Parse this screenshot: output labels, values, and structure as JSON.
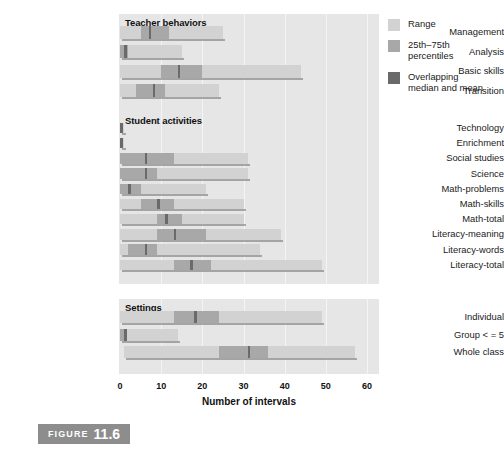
{
  "figure": {
    "caption_word": "FIGURE",
    "caption_number": "11.6"
  },
  "legend": {
    "items": [
      {
        "label": "Range",
        "color": "#d2d2d2",
        "key": "range"
      },
      {
        "label": "25th–75th\npercentiles",
        "color": "#a8a8a8",
        "key": "iqr"
      },
      {
        "label": "Overlapping\nmedian and mean",
        "color": "#6a6a6a",
        "key": "median"
      }
    ]
  },
  "chart_data": {
    "type": "bar",
    "title": "",
    "xlabel": "Number of intervals",
    "ylabel": "",
    "xlim": [
      0,
      60
    ],
    "xticks": [
      0,
      10,
      20,
      30,
      40,
      50,
      60
    ],
    "xtick_labels": [
      "0",
      "10",
      "20",
      "30",
      "40",
      "50",
      "60"
    ],
    "grid": true,
    "legend_position": "right",
    "orientation": "horizontal",
    "series": [
      {
        "name": "Range",
        "color": "#d2d2d2"
      },
      {
        "name": "25th–75th percentiles",
        "color": "#a8a8a8"
      },
      {
        "name": "Overlapping median and mean",
        "color": "#6a6a6a"
      }
    ],
    "panels": [
      {
        "title": "Teacher behaviors",
        "categories": [
          "Management",
          "Analysis",
          "Basic skills",
          "Transition"
        ],
        "bars": [
          {
            "category": "Management",
            "range_min": 0,
            "range_max": 25,
            "q1": 5,
            "q3": 12,
            "median": 7
          },
          {
            "category": "Analysis",
            "range_min": 0,
            "range_max": 15,
            "q1": 0,
            "q3": 2,
            "median": 1
          },
          {
            "category": "Basic skills",
            "range_min": 0,
            "range_max": 44,
            "q1": 10,
            "q3": 20,
            "median": 14
          },
          {
            "category": "Transition",
            "range_min": 0,
            "range_max": 24,
            "q1": 4,
            "q3": 11,
            "median": 8
          }
        ]
      },
      {
        "title": "Student activities",
        "categories": [
          "Technology",
          "Enrichment",
          "Social studies",
          "Science",
          "Math-problems",
          "Math-skills",
          "Math-total",
          "Literacy-meaning",
          "Literacy-words",
          "Literacy-total"
        ],
        "bars": [
          {
            "category": "Technology",
            "range_min": 0,
            "range_max": 1,
            "q1": 0,
            "q3": 0,
            "median": 0
          },
          {
            "category": "Enrichment",
            "range_min": 0,
            "range_max": 1,
            "q1": 0,
            "q3": 0,
            "median": 0
          },
          {
            "category": "Social studies",
            "range_min": 0,
            "range_max": 31,
            "q1": 0,
            "q3": 13,
            "median": 6
          },
          {
            "category": "Science",
            "range_min": 0,
            "range_max": 31,
            "q1": 0,
            "q3": 9,
            "median": 6
          },
          {
            "category": "Math-problems",
            "range_min": 0,
            "range_max": 21,
            "q1": 0,
            "q3": 5,
            "median": 2
          },
          {
            "category": "Math-skills",
            "range_min": 0,
            "range_max": 30,
            "q1": 5,
            "q3": 13,
            "median": 9
          },
          {
            "category": "Math-total",
            "range_min": 0,
            "range_max": 30,
            "q1": 9,
            "q3": 15,
            "median": 11
          },
          {
            "category": "Literacy-meaning",
            "range_min": 0,
            "range_max": 39,
            "q1": 9,
            "q3": 21,
            "median": 13
          },
          {
            "category": "Literacy-words",
            "range_min": 0,
            "range_max": 34,
            "q1": 2,
            "q3": 9,
            "median": 6
          },
          {
            "category": "Literacy-total",
            "range_min": 0,
            "range_max": 49,
            "q1": 13,
            "q3": 22,
            "median": 17
          }
        ]
      },
      {
        "title": "Settings",
        "categories": [
          "Individual",
          "Group < = 5",
          "Whole class"
        ],
        "bars": [
          {
            "category": "Individual",
            "range_min": 0,
            "range_max": 49,
            "q1": 13,
            "q3": 24,
            "median": 18
          },
          {
            "category": "Group < = 5",
            "range_min": 0,
            "range_max": 14,
            "q1": 0,
            "q3": 1,
            "median": 1
          },
          {
            "category": "Whole class",
            "range_min": 1,
            "range_max": 57,
            "q1": 24,
            "q3": 36,
            "median": 31
          }
        ]
      }
    ]
  }
}
